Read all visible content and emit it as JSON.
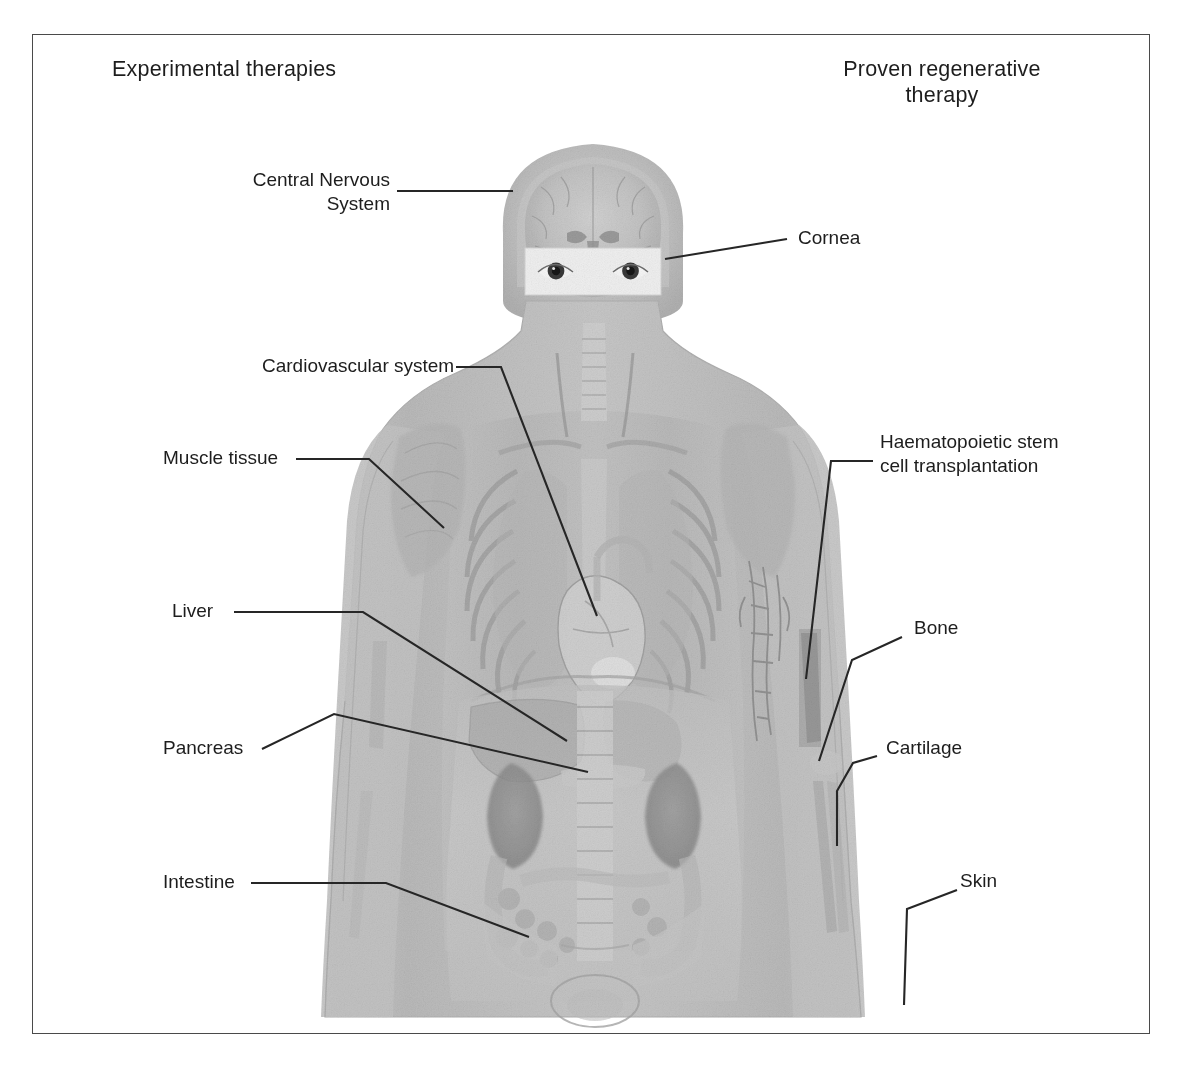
{
  "figure": {
    "title_left": "Experimental therapies",
    "title_right": "Proven regenerative\ntherapy",
    "caption_partial": "",
    "frame_color": "#4a4a4a",
    "leader_color": "#262626",
    "text_color": "#1d1d1d",
    "background_color": "#ffffff"
  },
  "illustration": {
    "description": "Translucent grayscale volume-rendered human body, front view, upper body and torso",
    "head": {
      "brain_section": "coronal brain slice visible inside skull",
      "eye_band": "photographic inset band showing two eyes across the face"
    },
    "visible_structures": [
      "brain",
      "eyes",
      "trachea",
      "ribcage",
      "lungs",
      "heart",
      "liver",
      "stomach",
      "pancreas",
      "kidneys",
      "intestines",
      "spine",
      "pelvis",
      "arm bones",
      "shoulder muscle",
      "skin outline"
    ]
  },
  "labels_left": [
    {
      "id": "central-nervous-system",
      "text": "Central Nervous\nSystem"
    },
    {
      "id": "cardiovascular-system",
      "text": "Cardiovascular system"
    },
    {
      "id": "muscle-tissue",
      "text": "Muscle tissue"
    },
    {
      "id": "liver",
      "text": "Liver"
    },
    {
      "id": "pancreas",
      "text": "Pancreas"
    },
    {
      "id": "intestine",
      "text": "Intestine"
    }
  ],
  "labels_right": [
    {
      "id": "cornea",
      "text": "Cornea"
    },
    {
      "id": "haematopoietic",
      "text": "Haematopoietic stem\ncell transplantation"
    },
    {
      "id": "bone",
      "text": "Bone"
    },
    {
      "id": "cartilage",
      "text": "Cartilage"
    },
    {
      "id": "skin",
      "text": "Skin"
    }
  ],
  "leader_lines": {
    "central_nervous_system": "M 396,190 L 512,190",
    "cardiovascular_system": "M 455,366 L 500,366 L 596,615",
    "muscle_tissue": "M 295,458 L 368,458 L 443,527",
    "liver": "M 233,611 L 362,611 L 566,740",
    "pancreas": "M 261,748 L 333,713 L 587,771",
    "intestine": "M 250,882 L 385,882 L 528,936",
    "cornea": "M 664,258 L 786,238",
    "haematopoietic": "M 872,460 L 830,460 L 805,678",
    "bone": "M 901,636 L 851,659 L 818,760",
    "cartilage": "M 876,755 L 852,762 L 836,790 L 836,845",
    "skin": "M 956,889 L 906,908 L 903,1004"
  }
}
